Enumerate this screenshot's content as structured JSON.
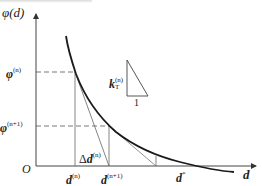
{
  "diagram": {
    "type": "newton-iteration-plot",
    "y_axis": {
      "label": "φ(d)"
    },
    "x_axis": {
      "label": "d"
    },
    "origin": {
      "label": "O"
    },
    "y_ticks": [
      {
        "symbol": "φ",
        "sup": "(n)"
      },
      {
        "symbol": "φ",
        "sup": "(n+1)"
      }
    ],
    "x_ticks": [
      {
        "symbol": "d",
        "sup": "(n)"
      },
      {
        "symbol": "d",
        "sup": "(n+1)"
      },
      {
        "symbol": "d",
        "sup": "*"
      }
    ],
    "step_label": {
      "prefix": "Δ",
      "symbol": "d",
      "sup": "(n)"
    },
    "slope_triangle": {
      "symbol": "k",
      "sub": "T",
      "sup": "(n)",
      "run": "1"
    },
    "colors": {
      "curve": "#1a1a1a",
      "axes": "#444444",
      "guides": "#555555",
      "tangent": "#666666"
    }
  }
}
